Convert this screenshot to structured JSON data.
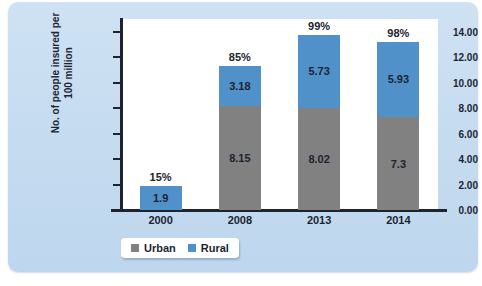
{
  "chart_data": {
    "type": "bar",
    "subtype": "stacked-bar",
    "title": "",
    "xlabel": "",
    "ylabel": "No. of people insured per 100 million",
    "ylabel_line1": "No. of people insured per",
    "ylabel_line2": "100 million",
    "categories": [
      "2000",
      "2008",
      "2013",
      "2014"
    ],
    "ylim": [
      0,
      15
    ],
    "ytick_values": [
      0,
      2,
      4,
      6,
      8,
      10,
      12,
      14
    ],
    "ytick_labels": [
      "0.00",
      "2.00",
      "4.00",
      "6.00",
      "8.00",
      "10.00",
      "12.00",
      "14.00"
    ],
    "grid": false,
    "legend_position": "bottom-left",
    "series": [
      {
        "name": "Urban",
        "color": "#818181",
        "values": [
          null,
          8.15,
          8.02,
          7.3
        ],
        "labels": [
          "",
          "8.15",
          "8.02",
          "7.3"
        ]
      },
      {
        "name": "Rural",
        "color": "#5191ca",
        "values": [
          1.9,
          3.18,
          5.73,
          5.93
        ],
        "labels": [
          "1.9",
          "3.18",
          "5.73",
          "5.93"
        ]
      }
    ],
    "annotations": {
      "name": "percent-above-bar",
      "values": [
        "15%",
        "85%",
        "99%",
        "98%"
      ]
    },
    "totals": [
      1.9,
      11.33,
      13.75,
      13.23
    ]
  },
  "legend": {
    "items": [
      {
        "label": "Urban",
        "color": "#818181"
      },
      {
        "label": "Rural",
        "color": "#5191ca"
      }
    ]
  },
  "colors": {
    "panel_background": "#c6dcf0",
    "plot_background": "#ffffff",
    "axis": "#1d2430",
    "urban": "#818181",
    "rural": "#5191ca",
    "text": "#1d2430"
  }
}
